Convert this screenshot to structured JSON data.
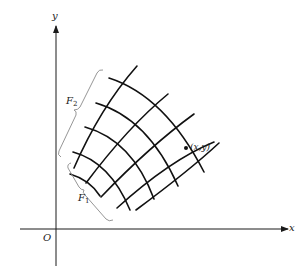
{
  "figure": {
    "type": "curvilinear coordinate grid diagram",
    "axes": {
      "x_label": "x",
      "y_label": "y",
      "origin_label": "O"
    },
    "point": {
      "label": "(x,y)"
    },
    "families": [
      {
        "name": "F",
        "subscript": "1",
        "curve_count": 5
      },
      {
        "name": "F",
        "subscript": "2",
        "curve_count": 5
      }
    ],
    "colors": {
      "ink": "#1a1a1a",
      "brace": "#8a8a8a",
      "background": "#ffffff"
    }
  }
}
